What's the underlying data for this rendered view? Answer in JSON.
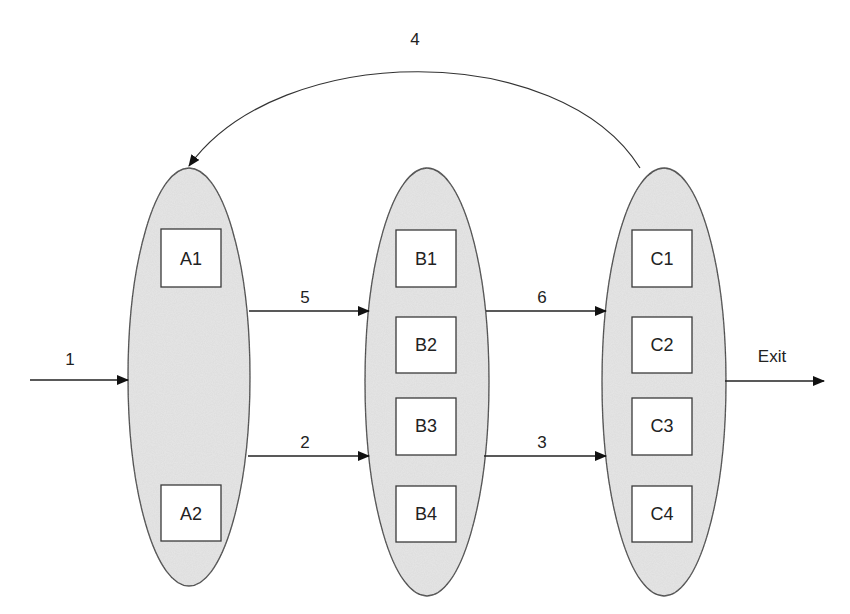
{
  "diagram": {
    "colors": {
      "stroke": "#3a3a3a",
      "ellipse_fill": "#e6e6e6",
      "box_fill": "#ffffff"
    },
    "groups": [
      {
        "id": "A",
        "boxes": [
          "A1",
          "A2"
        ]
      },
      {
        "id": "B",
        "boxes": [
          "B1",
          "B2",
          "B3",
          "B4"
        ]
      },
      {
        "id": "C",
        "boxes": [
          "C1",
          "C2",
          "C3",
          "C4"
        ]
      }
    ],
    "edges": [
      {
        "label": "1",
        "from": "entry",
        "to": "A"
      },
      {
        "label": "5",
        "from": "A",
        "to": "B"
      },
      {
        "label": "2",
        "from": "A",
        "to": "B"
      },
      {
        "label": "6",
        "from": "B",
        "to": "C"
      },
      {
        "label": "3",
        "from": "B",
        "to": "C"
      },
      {
        "label": "4",
        "from": "C",
        "to": "A"
      },
      {
        "label": "Exit",
        "from": "C",
        "to": "exit"
      }
    ]
  }
}
